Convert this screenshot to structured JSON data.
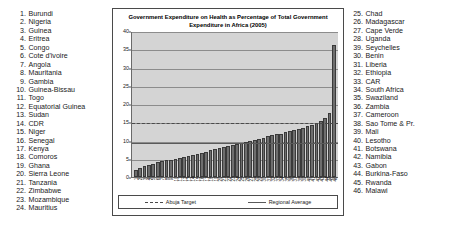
{
  "chart_data": {
    "type": "bar",
    "title": "Government Expenditure on Health as Percentage of Total Government Expenditure in Africa (2005)",
    "title_line1": "Government Expenditure on Health as Percentage of Total Government",
    "title_line2": "Expenditure in Africa (2005)",
    "xlabel": "",
    "ylabel": "",
    "ylim": [
      0,
      40
    ],
    "ytick_step": 5,
    "yticks": [
      0,
      5,
      10,
      15,
      20,
      25,
      30,
      35,
      40
    ],
    "grid": true,
    "legend_position": "bottom",
    "bar_color": "#6e6e6e",
    "plot_background": "#d4d4d4",
    "categories": [
      "1",
      "2",
      "3",
      "4",
      "5",
      "6",
      "7",
      "8",
      "9",
      "10",
      "11",
      "12",
      "13",
      "14",
      "15",
      "16",
      "17",
      "18",
      "19",
      "20",
      "21",
      "22",
      "23",
      "24",
      "25",
      "26",
      "27",
      "28",
      "29",
      "30",
      "31",
      "32",
      "33",
      "34",
      "35",
      "36",
      "37",
      "38",
      "39",
      "40",
      "41",
      "42",
      "43",
      "44",
      "45",
      "46"
    ],
    "values": [
      2.0,
      2.6,
      3.1,
      3.4,
      3.7,
      4.1,
      4.4,
      4.6,
      4.8,
      5.0,
      5.2,
      5.4,
      5.7,
      6.0,
      6.3,
      6.6,
      7.0,
      7.4,
      7.7,
      8.0,
      8.3,
      8.6,
      8.9,
      9.1,
      9.4,
      9.7,
      10.0,
      10.3,
      10.6,
      10.9,
      11.2,
      11.5,
      11.8,
      12.0,
      12.3,
      12.6,
      12.9,
      13.2,
      13.6,
      14.0,
      14.4,
      14.8,
      15.4,
      16.2,
      17.6,
      36.5
    ],
    "reference_lines": [
      {
        "name": "Abuja Target",
        "value": 15.0,
        "style": "dashed",
        "color": "#4a4a4a"
      },
      {
        "name": "Regional Average",
        "value": 9.6,
        "style": "solid",
        "color": "#5a5a5a"
      }
    ],
    "legend": [
      {
        "label": "Abuja Target",
        "style": "dashed"
      },
      {
        "label": "Regional Average",
        "style": "solid"
      }
    ]
  },
  "country_list_left": [
    {
      "num": "1.",
      "name": "Burundi"
    },
    {
      "num": "2.",
      "name": "Nigeria"
    },
    {
      "num": "3.",
      "name": "Guinea"
    },
    {
      "num": "4.",
      "name": "Eritrea"
    },
    {
      "num": "5.",
      "name": "Congo"
    },
    {
      "num": "6.",
      "name": "Cote d'ivoire"
    },
    {
      "num": "7.",
      "name": "Angola"
    },
    {
      "num": "8.",
      "name": "Mauritania"
    },
    {
      "num": "9.",
      "name": "Gambia"
    },
    {
      "num": "10.",
      "name": "Guinea-Bissau"
    },
    {
      "num": "11.",
      "name": "Togo"
    },
    {
      "num": "12.",
      "name": "Equatorial Guinea"
    },
    {
      "num": "13.",
      "name": "Sudan"
    },
    {
      "num": "14.",
      "name": "CDR"
    },
    {
      "num": "15.",
      "name": "Niger"
    },
    {
      "num": "16.",
      "name": "Senegal"
    },
    {
      "num": "17.",
      "name": "Kenya"
    },
    {
      "num": "18.",
      "name": "Comoros"
    },
    {
      "num": "19.",
      "name": "Ghana"
    },
    {
      "num": "20.",
      "name": "Sierra Leone"
    },
    {
      "num": "21.",
      "name": "Tanzania"
    },
    {
      "num": "22.",
      "name": "Zimbabwe"
    },
    {
      "num": "23.",
      "name": "Mozambique"
    },
    {
      "num": "24.",
      "name": "Mauritius"
    }
  ],
  "country_list_right": [
    {
      "num": "25.",
      "name": "Chad"
    },
    {
      "num": "26.",
      "name": "Madagascar"
    },
    {
      "num": "27.",
      "name": "Cape Verde"
    },
    {
      "num": "28.",
      "name": "Uganda"
    },
    {
      "num": "39.",
      "name": "Seychelles"
    },
    {
      "num": "30.",
      "name": "Benin"
    },
    {
      "num": "31.",
      "name": "Liberia"
    },
    {
      "num": "32.",
      "name": "Ethiopia"
    },
    {
      "num": "33.",
      "name": "CAR"
    },
    {
      "num": "34.",
      "name": "South Africa"
    },
    {
      "num": "35.",
      "name": "Swaziland"
    },
    {
      "num": "36.",
      "name": "Zambia"
    },
    {
      "num": "37.",
      "name": "Cameroon"
    },
    {
      "num": "38.",
      "name": "Sao Tome & Pr."
    },
    {
      "num": "39.",
      "name": "Mali"
    },
    {
      "num": "40.",
      "name": "Lesotho"
    },
    {
      "num": "41.",
      "name": "Botswana"
    },
    {
      "num": "42.",
      "name": "Namibia"
    },
    {
      "num": "43.",
      "name": "Gabon"
    },
    {
      "num": "44.",
      "name": "Burkina-Faso"
    },
    {
      "num": "45.",
      "name": "Rwanda"
    },
    {
      "num": "46.",
      "name": "Malawi"
    }
  ]
}
